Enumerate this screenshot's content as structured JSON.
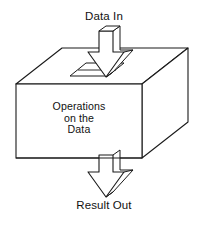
{
  "diagram": {
    "type": "block-flow-3d",
    "title_text_top": "Data In",
    "title_text_bottom": "Result Out",
    "background_color": "#ffffff",
    "stroke_color": "#1a1a1a",
    "fill_color": "#ffffff",
    "labels": {
      "input": "Data In",
      "output": "Result Out"
    },
    "process_box": {
      "name": "operations-box",
      "body_lines": [
        "Operations",
        "on the",
        "Data"
      ],
      "shape": "isometric-cuboid",
      "front_face": {
        "x": 16,
        "y": 84,
        "width": 126,
        "height": 74
      },
      "depth_offset": {
        "dx": 46,
        "dy": -36
      }
    },
    "arrows": [
      {
        "name": "input-arrow",
        "direction": "down",
        "style": "3d-block-arrow",
        "from_label": "Data In",
        "to": "operations-box-top-face"
      },
      {
        "name": "output-arrow",
        "direction": "down",
        "style": "3d-block-arrow",
        "from": "operations-box-bottom-face",
        "to_label": "Result Out"
      }
    ],
    "top_face_slot": {
      "name": "input-slot",
      "shape": "parallelogram"
    }
  }
}
